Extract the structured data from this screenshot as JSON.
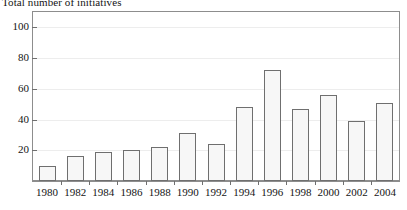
{
  "chart_data": {
    "type": "bar",
    "title": "Total number of initiatives",
    "xlabel": "",
    "ylabel": "",
    "ylim": [
      0,
      110
    ],
    "yticks": [
      20,
      40,
      60,
      80,
      100
    ],
    "ytick_labels": [
      "20",
      "40",
      "60",
      "80",
      "100"
    ],
    "grid": "horizontal-faint",
    "legend": "none",
    "categories": [
      "1980",
      "1982",
      "1984",
      "1986",
      "1988",
      "1990",
      "1992",
      "1994",
      "1996",
      "1998",
      "2000",
      "2002",
      "2004"
    ],
    "values": [
      10,
      16,
      19,
      20,
      22,
      31,
      24,
      48,
      72,
      47,
      56,
      39,
      51
    ],
    "bars": [
      {
        "label": "1980",
        "value": 10
      },
      {
        "label": "1982",
        "value": 16
      },
      {
        "label": "1984",
        "value": 19
      },
      {
        "label": "1986",
        "value": 20
      },
      {
        "label": "1988",
        "value": 22
      },
      {
        "label": "1990",
        "value": 31
      },
      {
        "label": "1992",
        "value": 24
      },
      {
        "label": "1994",
        "value": 48
      },
      {
        "label": "1996",
        "value": 72
      },
      {
        "label": "1998",
        "value": 47
      },
      {
        "label": "2000",
        "value": 56
      },
      {
        "label": "2002",
        "value": 39
      },
      {
        "label": "2004",
        "value": 51
      }
    ],
    "colors": {
      "bar_fill": "#f7f7f7",
      "bar_edge": "#6f6f6f",
      "frame": "#8d8d8d",
      "gridline": "#ededed",
      "text": "#141414"
    }
  }
}
